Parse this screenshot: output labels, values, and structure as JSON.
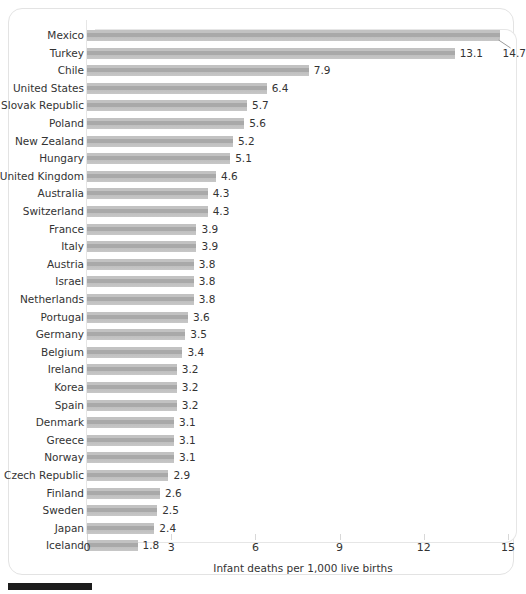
{
  "chart_data": {
    "type": "bar",
    "orientation": "horizontal",
    "title": "",
    "subtitle": "",
    "xlabel": "Infant deaths per 1,000 live births",
    "ylabel": "",
    "xlim": [
      0,
      15
    ],
    "xticks": [
      0,
      3,
      6,
      9,
      12,
      15
    ],
    "xtick_labels": [
      "0",
      "3",
      "6",
      "9",
      "12",
      "15"
    ],
    "grid": false,
    "legend": null,
    "bar_color": "#b8b8b8",
    "categories": [
      "Mexico",
      "Turkey",
      "Chile",
      "United States",
      "Slovak Republic",
      "Poland",
      "New Zealand",
      "Hungary",
      "United Kingdom",
      "Australia",
      "Switzerland",
      "France",
      "Italy",
      "Austria",
      "Israel",
      "Netherlands",
      "Portugal",
      "Germany",
      "Belgium",
      "Ireland",
      "Korea",
      "Spain",
      "Denmark",
      "Greece",
      "Norway",
      "Czech Republic",
      "Finland",
      "Sweden",
      "Japan",
      "Iceland"
    ],
    "values": [
      14.7,
      13.1,
      7.9,
      6.4,
      5.7,
      5.6,
      5.2,
      5.1,
      4.6,
      4.3,
      4.3,
      3.9,
      3.9,
      3.8,
      3.8,
      3.8,
      3.6,
      3.5,
      3.4,
      3.2,
      3.2,
      3.2,
      3.1,
      3.1,
      3.1,
      2.9,
      2.6,
      2.5,
      2.4,
      1.8
    ],
    "value_labels": [
      "14.7",
      "13.1",
      "7.9",
      "6.4",
      "5.7",
      "5.6",
      "5.2",
      "5.1",
      "4.6",
      "4.3",
      "4.3",
      "3.9",
      "3.9",
      "3.8",
      "3.8",
      "3.8",
      "3.6",
      "3.5",
      "3.4",
      "3.2",
      "3.2",
      "3.2",
      "3.1",
      "3.1",
      "3.1",
      "2.9",
      "2.6",
      "2.5",
      "2.4",
      "1.8"
    ],
    "annotations": [
      {
        "name": "leader-line-mexico",
        "for_category": "Mexico",
        "note": "thin callout line from end of Mexico bar down-right to its 14.7 label"
      }
    ]
  }
}
